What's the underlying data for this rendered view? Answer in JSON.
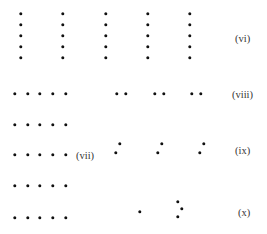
{
  "figure": {
    "groups": [
      {
        "id": "vi",
        "label": "(vi)",
        "label_pos": [
          235,
          38
        ],
        "description": "five vertical columns of five dots",
        "dots": [
          [
            21,
            14
          ],
          [
            21,
            25
          ],
          [
            21,
            36
          ],
          [
            21,
            47
          ],
          [
            21,
            58
          ],
          [
            63,
            14
          ],
          [
            63,
            25
          ],
          [
            63,
            36
          ],
          [
            63,
            47
          ],
          [
            63,
            58
          ],
          [
            106,
            14
          ],
          [
            106,
            25
          ],
          [
            106,
            36
          ],
          [
            106,
            47
          ],
          [
            106,
            58
          ],
          [
            148,
            14
          ],
          [
            148,
            25
          ],
          [
            148,
            36
          ],
          [
            148,
            47
          ],
          [
            148,
            58
          ],
          [
            190,
            14
          ],
          [
            190,
            25
          ],
          [
            190,
            36
          ],
          [
            190,
            47
          ],
          [
            190,
            58
          ]
        ]
      },
      {
        "id": "vii",
        "label": "(vii)",
        "label_pos": [
          76,
          155
        ],
        "description": "five horizontal rows of five dots",
        "dots": [
          [
            15,
            94
          ],
          [
            28,
            94
          ],
          [
            40,
            94
          ],
          [
            53,
            94
          ],
          [
            66,
            94
          ],
          [
            15,
            125
          ],
          [
            28,
            125
          ],
          [
            40,
            125
          ],
          [
            53,
            125
          ],
          [
            66,
            125
          ],
          [
            15,
            155
          ],
          [
            28,
            155
          ],
          [
            40,
            155
          ],
          [
            53,
            155
          ],
          [
            66,
            155
          ],
          [
            15,
            186
          ],
          [
            28,
            186
          ],
          [
            40,
            186
          ],
          [
            53,
            186
          ],
          [
            66,
            186
          ],
          [
            15,
            218
          ],
          [
            28,
            218
          ],
          [
            40,
            218
          ],
          [
            53,
            218
          ],
          [
            66,
            218
          ]
        ]
      },
      {
        "id": "viii",
        "label": "(viii)",
        "label_pos": [
          232,
          94
        ],
        "description": "three horizontal pairs of dots",
        "dots": [
          [
            117,
            94
          ],
          [
            126,
            94
          ],
          [
            155,
            94
          ],
          [
            164,
            94
          ],
          [
            192,
            94
          ],
          [
            201,
            94
          ]
        ]
      },
      {
        "id": "ix",
        "label": "(ix)",
        "label_pos": [
          235,
          150
        ],
        "description": "three slanted pairs of dots",
        "dots": [
          [
            120,
            144
          ],
          [
            116,
            153
          ],
          [
            162,
            144
          ],
          [
            158,
            153
          ],
          [
            204,
            144
          ],
          [
            200,
            153
          ]
        ]
      },
      {
        "id": "x",
        "label": "(x)",
        "label_pos": [
          238,
          212
        ],
        "description": "a single dot and a triangle of three dots",
        "dots": [
          [
            140,
            212
          ],
          [
            178,
            202
          ],
          [
            182,
            209
          ],
          [
            178,
            217
          ]
        ]
      }
    ]
  }
}
